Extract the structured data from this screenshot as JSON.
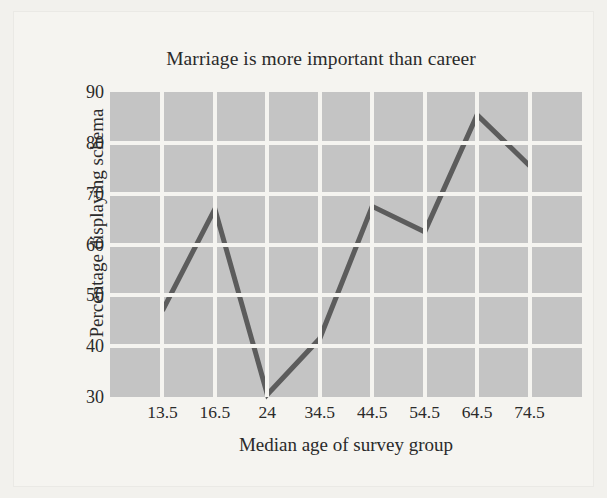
{
  "figure": {
    "title": "Marriage is more important than career",
    "x_axis_title": "Median age of survey group",
    "y_axis_title": "Percentage displaying schema"
  },
  "colors": {
    "plot_background": "#c4c4c4",
    "page_background": "#f5f4f0",
    "grid": "#f5f4f0",
    "line": "#5c5c5c",
    "text": "#2a2a2a"
  },
  "chart_data": {
    "type": "line",
    "title": "Marriage is more important than career",
    "xlabel": "Median age of survey group",
    "ylabel": "Percentage displaying schema",
    "categories": [
      "13.5",
      "16.5",
      "24",
      "34.5",
      "44.5",
      "54.5",
      "64.5",
      "74.5"
    ],
    "values": [
      47,
      67,
      30.5,
      41.5,
      67.5,
      62.5,
      85.5,
      75.5
    ],
    "ylim": [
      30,
      90
    ],
    "yticks": [
      30,
      40,
      50,
      60,
      70,
      80,
      90
    ],
    "ytick_labels": [
      "30",
      "40",
      "50",
      "60",
      "70",
      "80",
      "90"
    ],
    "xtick_labels": [
      "13.5",
      "16.5",
      "24",
      "34.5",
      "44.5",
      "54.5",
      "64.5",
      "74.5"
    ],
    "grid": true,
    "grid_orientation": "both",
    "legend": null,
    "series_color": "#5c5c5c",
    "line_width": 5
  },
  "bleed_artifacts": {
    "top": "",
    "bottom_left": "",
    "bottom_right": ""
  }
}
